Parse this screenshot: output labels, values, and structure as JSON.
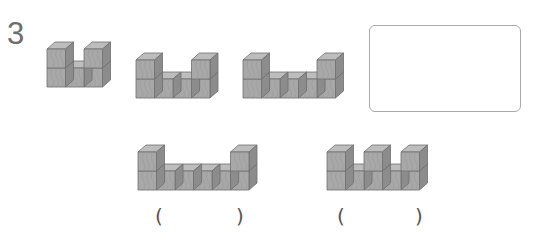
{
  "question": {
    "number": "3"
  },
  "colors": {
    "front_face": "#a8a8a8",
    "top_face": "#bdbdbd",
    "side_face": "#8c8c8c",
    "edge": "#6e6e6e",
    "grain": "#979797",
    "box_border": "#a9a9a9"
  },
  "cube": {
    "w": 18.5,
    "h": 19,
    "dx": 8,
    "dy": 7
  },
  "sequence": [
    {
      "id": "fig-1",
      "x": 47,
      "baseY": 87,
      "columns": [
        2,
        1,
        2
      ]
    },
    {
      "id": "fig-2",
      "x": 136,
      "baseY": 98,
      "columns": [
        2,
        1,
        1,
        2
      ]
    },
    {
      "id": "fig-3",
      "x": 243,
      "baseY": 98,
      "columns": [
        2,
        1,
        1,
        1,
        2
      ]
    }
  ],
  "answer_box": {
    "content": ""
  },
  "options": [
    {
      "id": "option-a",
      "x": 138,
      "baseY": 190,
      "columns": [
        2,
        1,
        1,
        1,
        1,
        2
      ],
      "paren_open": "(",
      "paren_close": ")",
      "answer": ""
    },
    {
      "id": "option-b",
      "x": 327,
      "baseY": 190,
      "columns": [
        2,
        1,
        2,
        1,
        2
      ],
      "paren_open": "(",
      "paren_close": ")",
      "answer": ""
    }
  ]
}
